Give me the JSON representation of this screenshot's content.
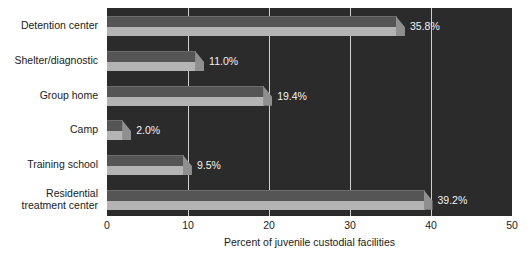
{
  "chart_data": {
    "type": "bar",
    "orientation": "horizontal",
    "title": "",
    "xlabel": "Percent of juvenile custodial facilities",
    "ylabel": "",
    "xlim": [
      0,
      50
    ],
    "xticks": [
      0,
      10,
      20,
      30,
      40,
      50
    ],
    "xticklabels": [
      "0",
      "10",
      "20",
      "30",
      "40",
      "50"
    ],
    "grid": true,
    "legend": false,
    "categories": [
      "Detention center",
      "Shelter/diagnostic",
      "Group home",
      "Camp",
      "Training school",
      "Residential\ntreatment center"
    ],
    "values": [
      35.8,
      11.0,
      19.4,
      2.0,
      9.5,
      39.2
    ],
    "data_labels": [
      "35.8%",
      "11.0%",
      "19.4%",
      "2.0%",
      "9.5%",
      "39.2%"
    ],
    "colors": {
      "plot_background": "#2b2b2b",
      "bar_face": "#b4b4b4",
      "bar_top": "#555555",
      "bar_tip": "#8f8f8f",
      "gridline": "#cfcfcf",
      "data_label": "#f2f2f2",
      "axis_text": "#1a1a1a",
      "page_background": "#ffffff"
    }
  }
}
